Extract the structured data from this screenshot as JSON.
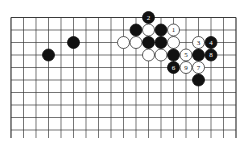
{
  "diagram": {
    "type": "go-board",
    "grid": {
      "columns": 19,
      "rows_visible": 10,
      "origin_x": 11,
      "origin_y": 17.5,
      "spacing": 12.5,
      "line_color": "#3a3a3a",
      "extends_below": true
    },
    "colors": {
      "black_stone": "#111111",
      "white_stone": "#ffffff",
      "white_outline": "#333333",
      "label_on_black": "#ffffff",
      "label_on_white": "#111111"
    },
    "stones": [
      {
        "color": "black",
        "col": 5,
        "row": 2,
        "label": ""
      },
      {
        "color": "black",
        "col": 3,
        "row": 3,
        "label": ""
      },
      {
        "color": "black",
        "col": 11,
        "row": 0,
        "label": "2"
      },
      {
        "color": "black",
        "col": 10,
        "row": 1,
        "label": ""
      },
      {
        "color": "white",
        "col": 11,
        "row": 1,
        "label": ""
      },
      {
        "color": "black",
        "col": 12,
        "row": 1,
        "label": ""
      },
      {
        "color": "white",
        "col": 13,
        "row": 1,
        "label": "1"
      },
      {
        "color": "white",
        "col": 9,
        "row": 2,
        "label": ""
      },
      {
        "color": "white",
        "col": 10,
        "row": 2,
        "label": ""
      },
      {
        "color": "black",
        "col": 11,
        "row": 2,
        "label": ""
      },
      {
        "color": "black",
        "col": 12,
        "row": 2,
        "label": ""
      },
      {
        "color": "white",
        "col": 13,
        "row": 2,
        "label": ""
      },
      {
        "color": "white",
        "col": 15,
        "row": 2,
        "label": "3"
      },
      {
        "color": "black",
        "col": 16,
        "row": 2,
        "label": "4"
      },
      {
        "color": "white",
        "col": 11,
        "row": 3,
        "label": ""
      },
      {
        "color": "white",
        "col": 12,
        "row": 3,
        "label": ""
      },
      {
        "color": "black",
        "col": 13,
        "row": 3,
        "label": ""
      },
      {
        "color": "white",
        "col": 14,
        "row": 3,
        "label": "5"
      },
      {
        "color": "black",
        "col": 15,
        "row": 3,
        "label": ""
      },
      {
        "color": "black",
        "col": 16,
        "row": 3,
        "label": "8"
      },
      {
        "color": "black",
        "col": 13,
        "row": 4,
        "label": "6"
      },
      {
        "color": "white",
        "col": 14,
        "row": 4,
        "label": "9"
      },
      {
        "color": "white",
        "col": 15,
        "row": 4,
        "label": "7"
      },
      {
        "color": "black",
        "col": 15,
        "row": 5,
        "label": ""
      }
    ]
  }
}
